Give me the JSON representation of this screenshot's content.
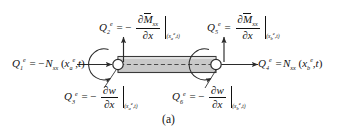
{
  "figure": {
    "caption": "(a)",
    "beam": {
      "fill_color": "#c9c9c9",
      "edge_color": "#3a3a3a",
      "centerline_style": "dashed",
      "node_fill": "#ffffff",
      "node_count": 2
    },
    "labels": {
      "Q1": {
        "symbol": "Q",
        "index": "1",
        "superscript": "e",
        "relation": "=",
        "sign": "−",
        "quantity": "N",
        "quantity_sub": "xx",
        "args": "(x",
        "arg_sub": "a",
        "arg_sup": "e",
        "arg_tail": ", t)",
        "text": "Q₁ᵉ = −Nₓₓ(xₐᵉ, t)"
      },
      "Q4": {
        "symbol": "Q",
        "index": "4",
        "superscript": "e",
        "relation": "=",
        "sign": "",
        "quantity": "N",
        "quantity_sub": "xx",
        "args": "(x",
        "arg_sub": "b",
        "arg_sup": "e",
        "arg_tail": ", t)",
        "text": "Q₄ᵉ = Nₓₓ(x_bᵉ, t)"
      },
      "Q2": {
        "symbol": "Q",
        "index": "2",
        "superscript": "e",
        "relation": "=",
        "sign": "−",
        "numerator_partial": "∂",
        "numerator_var": "M",
        "numerator_var_bar": true,
        "numerator_sub": "xx",
        "denominator_partial": "∂",
        "denominator_var": "x",
        "eval_x": "x",
        "eval_node": "a",
        "eval_sup": "e",
        "eval_t": "t",
        "text": "Q₂ᵉ = −∂M̄ₓₓ/∂x |(xₐᵉ,t)"
      },
      "Q5": {
        "symbol": "Q",
        "index": "5",
        "superscript": "e",
        "relation": "=",
        "sign": "",
        "numerator_partial": "∂",
        "numerator_var": "M",
        "numerator_var_bar": true,
        "numerator_sub": "xx",
        "denominator_partial": "∂",
        "denominator_var": "x",
        "eval_x": "x",
        "eval_node": "b",
        "eval_sup": "e",
        "eval_t": "t",
        "text": "Q₅ᵉ = ∂M̄ₓₓ/∂x |(x_bᵉ,t)"
      },
      "Q3": {
        "symbol": "Q",
        "index": "3",
        "superscript": "e",
        "relation": "=",
        "sign": "−",
        "numerator_partial": "∂",
        "numerator_var": "w",
        "denominator_partial": "∂",
        "denominator_var": "x",
        "eval_x": "x",
        "eval_node": "a",
        "eval_sup": "e",
        "eval_t": "t",
        "text": "Q₃ᵉ = −∂w/∂x |(xₐᵉ,t)"
      },
      "Q6": {
        "symbol": "Q",
        "index": "6",
        "superscript": "e",
        "relation": "=",
        "sign": "−",
        "numerator_partial": "∂",
        "numerator_var": "w",
        "denominator_partial": "∂",
        "denominator_var": "x",
        "eval_x": "x",
        "eval_node": "b",
        "eval_sup": "e",
        "eval_t": "t",
        "text": "Q₆ᵉ = −∂w/∂x |(x_bᵉ,t)"
      }
    }
  }
}
